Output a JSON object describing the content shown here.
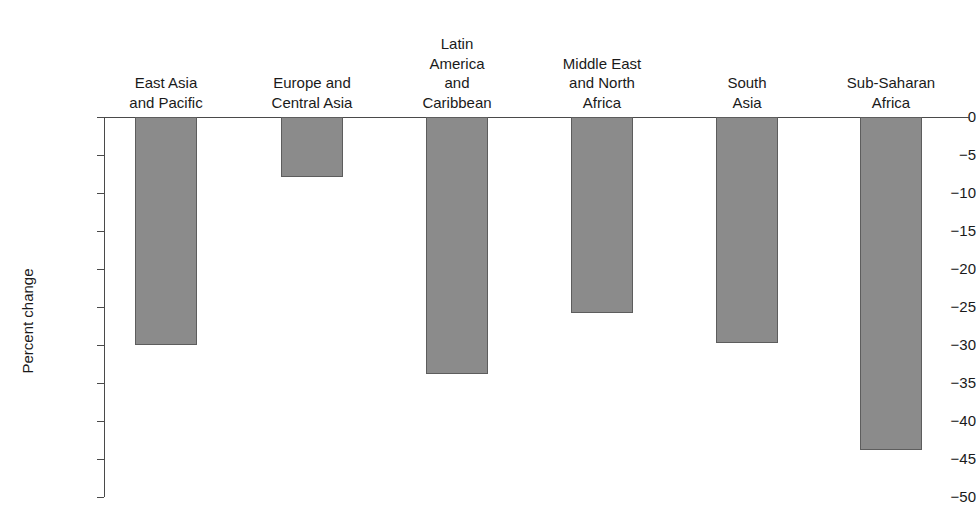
{
  "chart_data": {
    "type": "bar",
    "title": "",
    "subtitle": "",
    "xlabel": "",
    "ylabel": "Percent change",
    "ylim": [
      -50,
      0
    ],
    "grid": false,
    "legend": null,
    "orientation": "vertical",
    "bar_color": "#8b8b8b",
    "bar_edge_color": "#5d5d5d",
    "axis_color": "#4a4a4a",
    "categories": [
      "East Asia\nand Pacific",
      "Europe and\nCentral Asia",
      "Latin\nAmerica\nand\nCaribbean",
      "Middle East\nand North\nAfrica",
      "South\nAsia",
      "Sub-Saharan\nAfrica"
    ],
    "values": [
      -30.0,
      -7.9,
      -33.8,
      -25.8,
      -29.7,
      -43.8
    ],
    "ytick_labels": [
      "0",
      "−5",
      "−10",
      "−15",
      "−20",
      "−25",
      "−30",
      "−35",
      "−40",
      "−45",
      "−50"
    ],
    "ytick_values": [
      0,
      -5,
      -10,
      -15,
      -20,
      -25,
      -30,
      -35,
      -40,
      -45,
      -50
    ]
  }
}
